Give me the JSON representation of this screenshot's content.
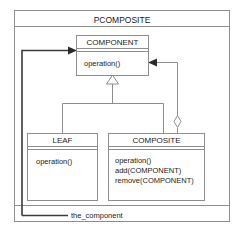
{
  "diagram": {
    "package_name": "PCOMPOSITE",
    "association_label": "the_component",
    "colors": {
      "background": "#ffffff",
      "stroke": "#8d8d8d",
      "association_stroke": "#3a3a3a",
      "text": "#1a1a1a"
    }
  },
  "classes": {
    "component": {
      "name": "COMPONENT",
      "operations": [
        "operation()"
      ]
    },
    "leaf": {
      "name": "LEAF",
      "operations": [
        "operation()"
      ]
    },
    "composite": {
      "name": "COMPOSITE",
      "operations": [
        "operation()",
        "add(COMPONENT)",
        "remove(COMPONENT)"
      ]
    }
  }
}
